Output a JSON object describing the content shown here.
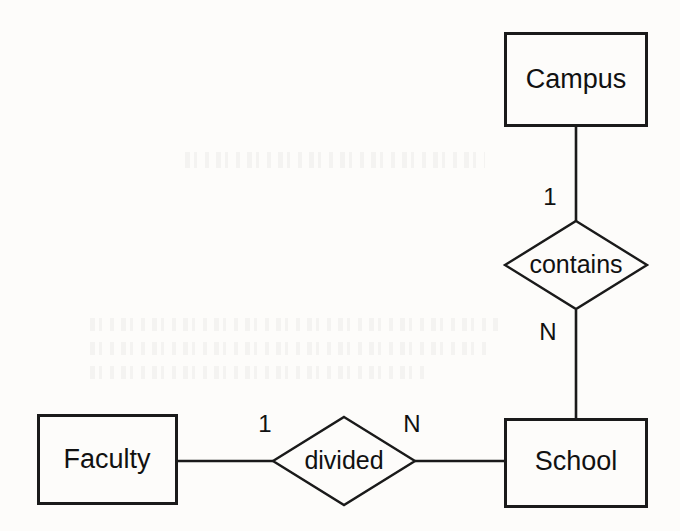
{
  "diagram": {
    "type": "entity-relationship-diagram",
    "notation": "chen",
    "background_color": "#fdfcfa",
    "line_color": "#1a1a1a",
    "entities": [
      {
        "id": "campus",
        "label": "Campus",
        "x": 504,
        "y": 32,
        "width": 143,
        "height": 94
      },
      {
        "id": "school",
        "label": "School",
        "x": 504,
        "y": 418,
        "width": 143,
        "height": 89
      },
      {
        "id": "faculty",
        "label": "Faculty",
        "x": 37,
        "y": 414,
        "width": 140,
        "height": 90
      }
    ],
    "relationships": [
      {
        "id": "contains",
        "label": "contains",
        "cx": 576,
        "cy": 265,
        "rx": 72,
        "ry": 45
      },
      {
        "id": "divided",
        "label": "divided",
        "cx": 344,
        "cy": 461,
        "rx": 72,
        "ry": 44
      }
    ],
    "connections": [
      {
        "id": "campus-contains",
        "from": "campus",
        "to": "contains",
        "cardinality": "1",
        "cardinality_x": 550,
        "cardinality_y": 198,
        "orientation": "vertical"
      },
      {
        "id": "contains-school",
        "from": "contains",
        "to": "school",
        "cardinality": "N",
        "cardinality_x": 548,
        "cardinality_y": 333,
        "orientation": "vertical"
      },
      {
        "id": "faculty-divided",
        "from": "faculty",
        "to": "divided",
        "cardinality": "1",
        "cardinality_x": 265,
        "cardinality_y": 425,
        "orientation": "horizontal"
      },
      {
        "id": "divided-school",
        "from": "divided",
        "to": "school",
        "cardinality": "N",
        "cardinality_x": 412,
        "cardinality_y": 425,
        "orientation": "horizontal"
      }
    ]
  }
}
